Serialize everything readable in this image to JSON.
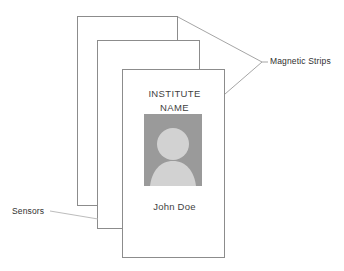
{
  "diagram": {
    "background_color": "#ffffff",
    "outline_color": "#8c8c8c",
    "leader_line_color": "#9b9b9b",
    "text_color": "#3f3f3f"
  },
  "cards": [
    {
      "id": "card-back",
      "label": "back-card"
    },
    {
      "id": "card-middle",
      "label": "middle-card"
    },
    {
      "id": "card-front",
      "label": "front-card"
    }
  ],
  "front_card": {
    "institute_name": "INSTITUTE\nNAME",
    "holder_name": "John Doe",
    "photo": {
      "icon": "person-avatar-icon",
      "background_color": "#9a9a9a",
      "silhouette_color": "#d2d2d2"
    }
  },
  "annotations": [
    {
      "id": "magnetic-strips",
      "text": "Magnetic Strips",
      "points_to": [
        "back-card-top-right",
        "front-card-top-right"
      ]
    },
    {
      "id": "sensors",
      "text": "Sensors",
      "points_to": [
        "middle-card-bottom-left"
      ]
    }
  ]
}
